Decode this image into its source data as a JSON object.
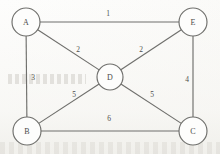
{
  "figure": {
    "kind": "weighted-undirected-graph",
    "background_color": "#fdfdfc",
    "stroke_color": "#6f6f6c",
    "text_color": "#4a4a48"
  },
  "nodes": [
    {
      "id": "A",
      "label": "A",
      "cx": 26,
      "cy": 22,
      "r": 14
    },
    {
      "id": "E",
      "label": "E",
      "cx": 193,
      "cy": 22,
      "r": 14
    },
    {
      "id": "D",
      "label": "D",
      "cx": 110,
      "cy": 77,
      "r": 13
    },
    {
      "id": "B",
      "label": "B",
      "cx": 27,
      "cy": 131,
      "r": 14
    },
    {
      "id": "C",
      "label": "C",
      "cx": 193,
      "cy": 131,
      "r": 14
    }
  ],
  "edges": [
    {
      "from": "A",
      "to": "E",
      "weight": "1",
      "lx": 108,
      "ly": 14
    },
    {
      "from": "A",
      "to": "D",
      "weight": "2",
      "lx": 78,
      "ly": 50
    },
    {
      "from": "D",
      "to": "E",
      "weight": "2",
      "lx": 141,
      "ly": 50
    },
    {
      "from": "A",
      "to": "B",
      "weight": "3",
      "lx": 33,
      "ly": 78
    },
    {
      "from": "E",
      "to": "C",
      "weight": "4",
      "lx": 187,
      "ly": 80
    },
    {
      "from": "B",
      "to": "D",
      "weight": "5",
      "lx": 74,
      "ly": 95
    },
    {
      "from": "D",
      "to": "C",
      "weight": "5",
      "lx": 152,
      "ly": 95
    },
    {
      "from": "B",
      "to": "C",
      "weight": "6",
      "lx": 109,
      "ly": 119
    }
  ],
  "chart_data": {
    "type": "diagram",
    "title": "",
    "vertices": [
      "A",
      "B",
      "C",
      "D",
      "E"
    ],
    "edge_list": [
      [
        "A",
        "E",
        1
      ],
      [
        "A",
        "D",
        2
      ],
      [
        "D",
        "E",
        2
      ],
      [
        "A",
        "B",
        3
      ],
      [
        "E",
        "C",
        4
      ],
      [
        "B",
        "D",
        5
      ],
      [
        "D",
        "C",
        5
      ],
      [
        "B",
        "C",
        6
      ]
    ]
  }
}
